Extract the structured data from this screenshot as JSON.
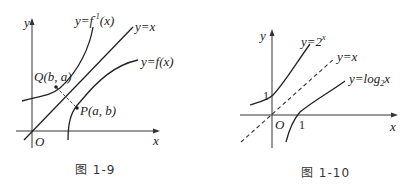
{
  "figures": [
    {
      "id": "fig-1-9",
      "caption": "图 1-9",
      "axes": {
        "x_label": "x",
        "y_label": "y",
        "origin_label": "O"
      },
      "curves": [
        {
          "name": "inverse-function",
          "label_prefix": "y=f",
          "label_sup": "-1",
          "label_suffix": "(x)"
        },
        {
          "name": "identity-line",
          "label": "y=x"
        },
        {
          "name": "function",
          "label": "y=f(x)"
        }
      ],
      "points": [
        {
          "name": "Q",
          "label": "Q(b, a)"
        },
        {
          "name": "P",
          "label": "P(a, b)"
        }
      ]
    },
    {
      "id": "fig-1-10",
      "caption": "图 1-10",
      "axes": {
        "x_label": "x",
        "y_label": "y",
        "origin_label": "O"
      },
      "curves": [
        {
          "name": "exponential",
          "label_prefix": "y=2",
          "label_sup": "x"
        },
        {
          "name": "identity-line-dashed",
          "label": "y=x"
        },
        {
          "name": "logarithm",
          "label_prefix": "y=log",
          "label_sub": "2",
          "label_suffix": "x"
        }
      ],
      "ticks": {
        "y_intercept": "1",
        "x_intercept": "1"
      }
    }
  ]
}
